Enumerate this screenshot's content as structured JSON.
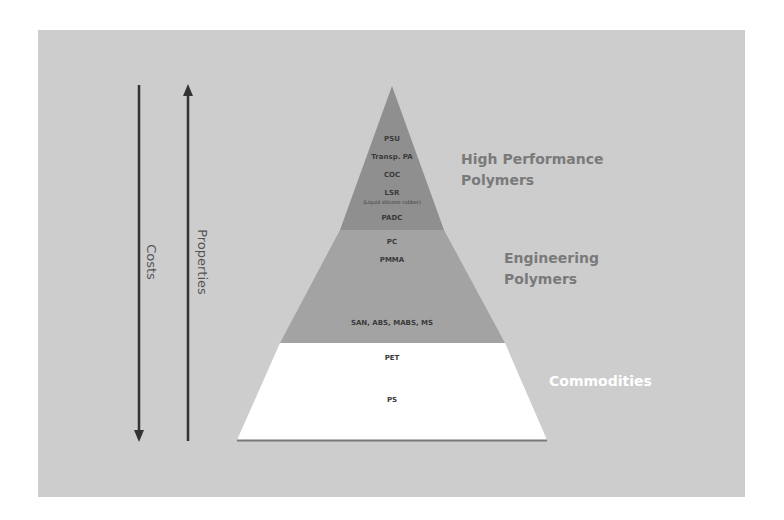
{
  "diagram": {
    "type": "pyramid",
    "colors": {
      "background": "#cdcdcd",
      "high_performance": "#8f8f8f",
      "engineering": "#a3a3a3",
      "commodities": "#ffffff",
      "arrow": "#333333",
      "category_label_dark": "#7a7a7a",
      "category_label_light": "#ffffff"
    },
    "axes": {
      "costs": {
        "label": "Costs",
        "direction": "down"
      },
      "properties": {
        "label": "Properties",
        "direction": "up"
      }
    },
    "tiers": [
      {
        "name": "High Performance Polymers",
        "line1": "High Performance",
        "line2": "Polymers",
        "items": [
          "PSU",
          "Transp. PA",
          "COC",
          "LSR",
          "(Liquid silicone rubber)",
          "PADC"
        ]
      },
      {
        "name": "Engineering Polymers",
        "line1": "Engineering",
        "line2": "Polymers",
        "items": [
          "PC",
          "PMMA",
          "SAN, ABS, MABS, MS"
        ]
      },
      {
        "name": "Commodities",
        "line1": "Commodities",
        "items": [
          "PET",
          "PS"
        ]
      }
    ]
  }
}
